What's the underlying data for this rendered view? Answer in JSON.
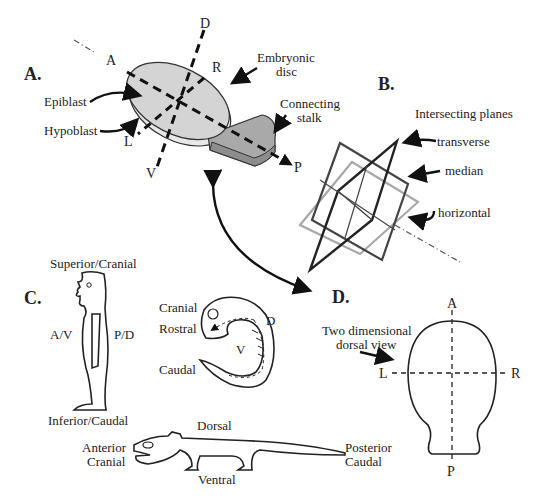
{
  "panels": {
    "A": {
      "label": "A.",
      "axes": {
        "anterior": "A",
        "posterior": "P",
        "dorsal": "D",
        "ventral": "V",
        "left": "L",
        "right": "R"
      },
      "callouts": {
        "embryonic_disc_1": "Embryonic",
        "embryonic_disc_2": "disc",
        "connecting_stalk_1": "Connecting",
        "connecting_stalk_2": "stalk",
        "epiblast": "Epiblast",
        "hypoblast": "Hypoblast"
      }
    },
    "B": {
      "label": "B.",
      "title": "Intersecting planes",
      "planes": {
        "transverse": "transverse",
        "median": "median",
        "horizontal": "horizontal"
      }
    },
    "C": {
      "label": "C.",
      "human": {
        "top": "Superior/Cranial",
        "bottom": "Inferior/Caudal",
        "front": "A/V",
        "back": "P/D"
      },
      "embryo": {
        "cranial": "Cranial",
        "rostral": "Rostral",
        "caudal": "Caudal",
        "dorsal": "D",
        "ventral": "V"
      },
      "lizard": {
        "dorsal": "Dorsal",
        "ventral": "Ventral",
        "anterior_1": "Anterior",
        "anterior_2": "Cranial",
        "posterior_1": "Posterior",
        "posterior_2": "Caudal"
      }
    },
    "D": {
      "label": "D.",
      "caption_1": "Two dimensional",
      "caption_2": "dorsal view",
      "axes": {
        "anterior": "A",
        "posterior": "P",
        "left": "L",
        "right": "R"
      }
    }
  },
  "colors": {
    "disc": "#d4d4d4",
    "stalk": "#a9a9a9",
    "plane_dark": "#444444",
    "plane_light": "#a8a8a8"
  }
}
